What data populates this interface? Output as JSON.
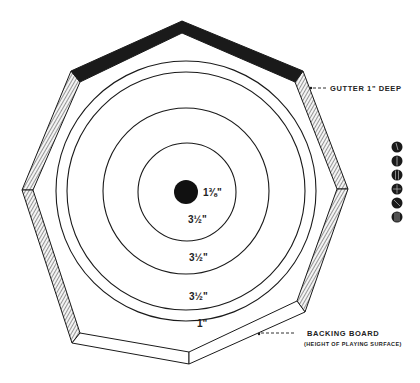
{
  "diagram": {
    "type": "technical-drawing",
    "center": {
      "x": 186,
      "y": 191
    },
    "shape": {
      "outer_octagon": [
        [
          182,
          21
        ],
        [
          71,
          71
        ],
        [
          22,
          190
        ],
        [
          72,
          343
        ],
        [
          189,
          364
        ],
        [
          305,
          312
        ],
        [
          348,
          189
        ],
        [
          303,
          71
        ]
      ],
      "inner_octagon": [
        [
          182,
          33
        ],
        [
          80,
          82
        ],
        [
          33,
          190
        ],
        [
          80,
          333
        ],
        [
          189,
          352
        ],
        [
          297,
          301
        ],
        [
          337,
          189
        ],
        [
          295,
          82
        ]
      ]
    },
    "rings": [
      {
        "name": "bullseye",
        "radius": 12,
        "filled": true,
        "label": "1⅜\""
      },
      {
        "name": "ring-1",
        "radius": 49,
        "label": "3½\""
      },
      {
        "name": "ring-2",
        "radius": 83,
        "label": "3½\""
      },
      {
        "name": "ring-3",
        "radius": 119,
        "label": "3½\""
      },
      {
        "name": "ring-4",
        "radius": 130,
        "label": "1\""
      }
    ],
    "labels": {
      "bullseye_dim": "1⅜\"",
      "ring1_dim": "3½\"",
      "ring2_dim": "3½\"",
      "ring3_dim": "3½\"",
      "outer_dim": "1\"",
      "gutter": "GUTTER 1\" DEEP",
      "backing_board": "BACKING BOARD",
      "backing_board_note": "(HEIGHT OF PLAYING SURFACE)"
    },
    "tokens": {
      "count": 6,
      "items": [
        {
          "y": 147
        },
        {
          "y": 161
        },
        {
          "y": 175
        },
        {
          "y": 189
        },
        {
          "y": 203
        },
        {
          "y": 217
        }
      ],
      "color": "#1a1a1a"
    },
    "colors": {
      "ink": "#1a1a1a",
      "hatch": "#555555",
      "background": "#ffffff"
    }
  }
}
